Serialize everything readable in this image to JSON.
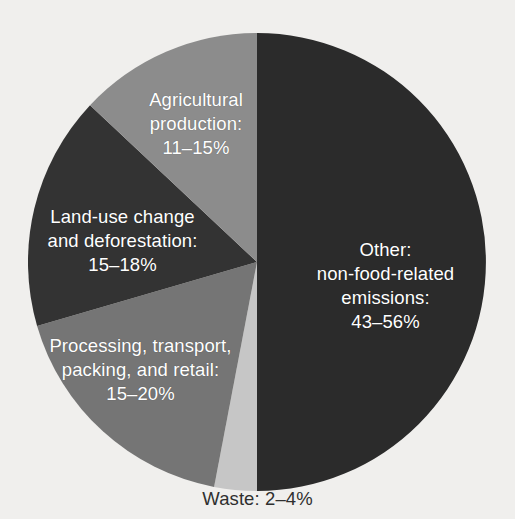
{
  "chart_data": {
    "type": "pie",
    "title": "",
    "subtitle": "",
    "xlabel": "",
    "ylabel": "",
    "legend_position": "none",
    "grid": false,
    "note": "Slice labels are drawn inside the wedges; the Waste label sits below the pie.",
    "background_color": "#f0efed",
    "categories": [
      "Other: non-food-related emissions",
      "Waste",
      "Processing, transport, packing, and retail",
      "Land-use change and deforestation",
      "Agricultural production"
    ],
    "values": [
      49.5,
      3.0,
      17.5,
      16.5,
      13.5
    ],
    "value_ranges": [
      {
        "label": "43–56%",
        "min": 43,
        "max": 56
      },
      {
        "label": "2–4%",
        "min": 2,
        "max": 4
      },
      {
        "label": "15–20%",
        "min": 15,
        "max": 20
      },
      {
        "label": "15–18%",
        "min": 15,
        "max": 18
      },
      {
        "label": "11–15%",
        "min": 11,
        "max": 15
      }
    ],
    "colors": [
      "#2b2b2b",
      "#c6c6c6",
      "#757575",
      "#333333",
      "#8c8c8c"
    ],
    "slices": [
      {
        "name": "other",
        "label_lines": [
          "Other:",
          "non-food-related",
          "emissions:",
          "43–56%"
        ],
        "percent_label": "43–56%",
        "color": "#2b2b2b",
        "start_angle": 0,
        "end_angle": 180,
        "text_color": "#ffffff"
      },
      {
        "name": "waste",
        "label_lines": [
          "Waste: 2–4%"
        ],
        "percent_label": "2–4%",
        "color": "#c6c6c6",
        "start_angle": 180,
        "end_angle": 190.8,
        "text_color": "#2f2f2f"
      },
      {
        "name": "processing",
        "label_lines": [
          "Processing, transport,",
          "packing, and retail:",
          "15–20%"
        ],
        "percent_label": "15–20%",
        "color": "#757575",
        "start_angle": 190.8,
        "end_angle": 253.8,
        "text_color": "#ffffff"
      },
      {
        "name": "landuse",
        "label_lines": [
          "Land-use change",
          "and deforestation:",
          "15–18%"
        ],
        "percent_label": "15–18%",
        "color": "#333333",
        "start_angle": 253.8,
        "end_angle": 313.2,
        "text_color": "#ffffff"
      },
      {
        "name": "agricultural",
        "label_lines": [
          "Agricultural",
          "production:",
          "11–15%"
        ],
        "percent_label": "11–15%",
        "color": "#8c8c8c",
        "start_angle": 313.2,
        "end_angle": 360,
        "text_color": "#ffffff"
      }
    ],
    "geometry": {
      "center_x": 257,
      "center_y": 262,
      "radius": 229
    }
  },
  "labels": {
    "agricultural": {
      "line1": "Agricultural",
      "line2": "production:",
      "line3": "11–15%"
    },
    "landuse": {
      "line1": "Land-use change",
      "line2": "and deforestation:",
      "line3": "15–18%"
    },
    "processing": {
      "line1": "Processing, transport,",
      "line2": "packing, and retail:",
      "line3": "15–20%"
    },
    "other": {
      "line1": "Other:",
      "line2": "non-food-related",
      "line3": "emissions:",
      "line4": "43–56%"
    },
    "waste": {
      "line1": "Waste: 2–4%"
    }
  }
}
